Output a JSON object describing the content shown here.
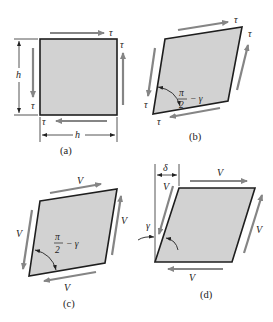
{
  "figure": {
    "panels": [
      {
        "id": "a",
        "caption": "(a)",
        "shape": "square",
        "stress_labels": [
          "τ",
          "τ",
          "τ",
          "τ"
        ],
        "dimension_labels": [
          "h",
          "h"
        ]
      },
      {
        "id": "b",
        "caption": "(b)",
        "shape": "rhombus",
        "stress_labels": [
          "τ",
          "τ",
          "τ",
          "τ"
        ],
        "angle_label": {
          "numerator": "π",
          "denominator": "2",
          "suffix": "− γ"
        }
      },
      {
        "id": "c",
        "caption": "(c)",
        "shape": "rhombus",
        "force_labels": [
          "V",
          "V",
          "V",
          "V"
        ],
        "angle_label": {
          "numerator": "π",
          "denominator": "2",
          "suffix": "− γ"
        }
      },
      {
        "id": "d",
        "caption": "(d)",
        "shape": "parallelogram",
        "force_labels": [
          "V",
          "V",
          "V",
          "V"
        ],
        "displacement_label": "δ",
        "angle_label": "γ"
      }
    ],
    "colors": {
      "fill": "#d2d2d2",
      "outline": "#1e1e1e",
      "arrow": "#858585",
      "text": "#222222"
    }
  }
}
